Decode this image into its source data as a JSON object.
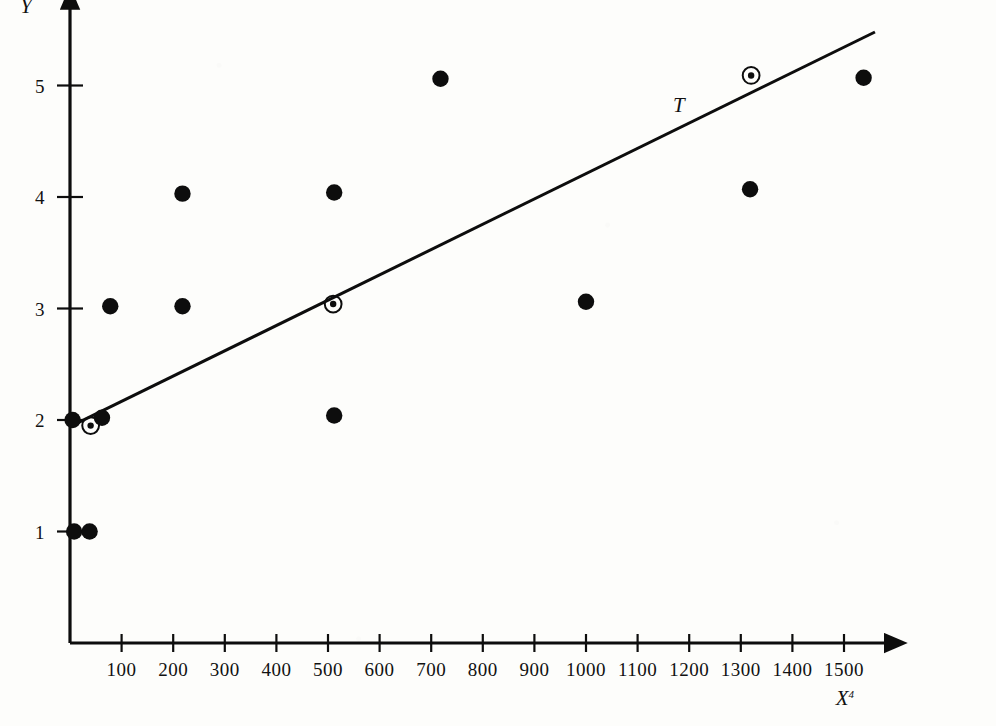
{
  "chart_data": {
    "type": "scatter",
    "title": "",
    "subtitle": "",
    "xlabel": "X",
    "xlabel_superscript": "4",
    "ylabel": "Y",
    "xlim": [
      0,
      1560
    ],
    "ylim": [
      0,
      5.6
    ],
    "grid": false,
    "legend": "none",
    "x_ticks": [
      100,
      200,
      300,
      400,
      500,
      600,
      700,
      800,
      900,
      1000,
      1100,
      1200,
      1300,
      1400,
      1500
    ],
    "x_tick_labels": [
      "100",
      "200",
      "300",
      "400",
      "500",
      "600",
      "700",
      "800",
      "900",
      "1000",
      "1100",
      "1200",
      "1300",
      "1400",
      "1500"
    ],
    "y_ticks": [
      1,
      2,
      3,
      4,
      5
    ],
    "y_tick_labels": [
      "1",
      "2",
      "3",
      "4",
      "5"
    ],
    "series": [
      {
        "name": "observations",
        "marker": "filled-circle",
        "points": [
          {
            "x": 8,
            "y": 1.0
          },
          {
            "x": 38,
            "y": 1.0
          },
          {
            "x": 5,
            "y": 2.0
          },
          {
            "x": 62,
            "y": 2.02
          },
          {
            "x": 78,
            "y": 3.02
          },
          {
            "x": 218,
            "y": 3.02
          },
          {
            "x": 218,
            "y": 4.03
          },
          {
            "x": 512,
            "y": 4.04
          },
          {
            "x": 512,
            "y": 2.04
          },
          {
            "x": 718,
            "y": 5.06
          },
          {
            "x": 1000,
            "y": 3.06
          },
          {
            "x": 1318,
            "y": 4.07
          },
          {
            "x": 1538,
            "y": 5.07
          }
        ]
      },
      {
        "name": "highlighted-observations",
        "marker": "circled-dot",
        "points": [
          {
            "x": 40,
            "y": 1.95
          },
          {
            "x": 510,
            "y": 3.04
          },
          {
            "x": 1320,
            "y": 5.09
          }
        ]
      }
    ],
    "trend_line": {
      "label": "T",
      "name": "trend-line-T",
      "x_start": 0,
      "y_start": 1.94,
      "x_end": 1560,
      "y_end": 5.48
    },
    "annotations": [
      {
        "text": "T",
        "x": 1180,
        "y": 4.76
      }
    ]
  },
  "axes": {
    "y_axis_name": "Y",
    "x_axis_name": "X",
    "x_axis_superscript": "4",
    "trend_label": "T"
  },
  "colors": {
    "ink": "#0d0d0d",
    "paper": "#fdfdfb"
  }
}
